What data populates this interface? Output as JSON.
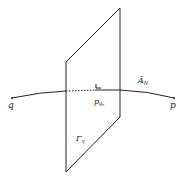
{
  "diagram": {
    "labels": {
      "q": "q",
      "p": "p",
      "p_sub_base": "p",
      "p_sub_sub": "θ",
      "p_sub_sub2": "*",
      "A_base": "Â",
      "A_sub": "N",
      "Gamma_base": "Γ",
      "Gamma_sub": "η"
    },
    "colors": {
      "stroke": "#222222",
      "background": "#ffffff"
    }
  }
}
